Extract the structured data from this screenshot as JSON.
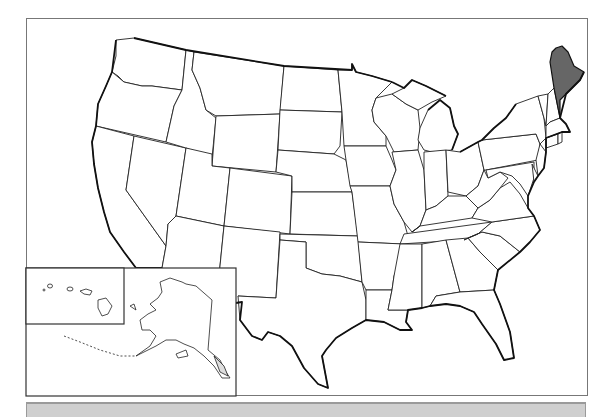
{
  "map": {
    "type": "US states outline map",
    "highlighted_state": "Maine",
    "highlight_color": "#666666",
    "state_fill_color": "#ffffff",
    "border_color": "#222222",
    "insets": [
      "Hawaii",
      "Alaska"
    ]
  },
  "bottom_bar": {
    "text": "",
    "color": "#cfcfcf"
  }
}
